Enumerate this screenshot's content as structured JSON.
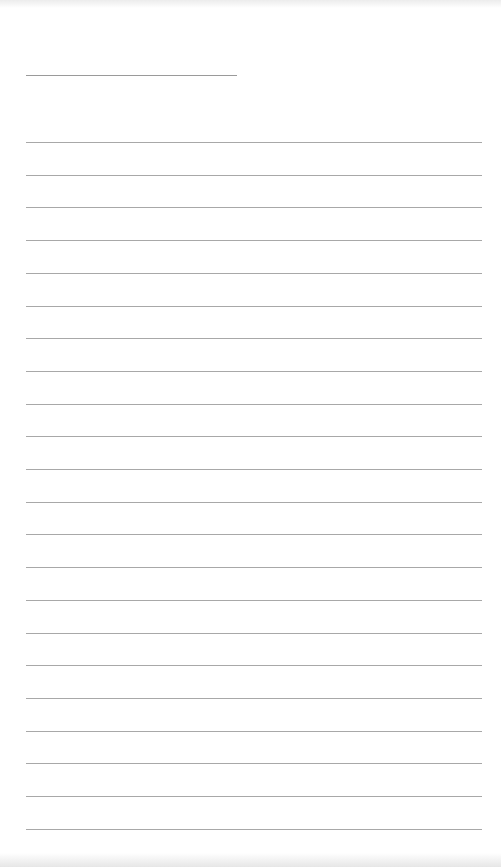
{
  "page": {
    "type": "lined-paper",
    "background_color": "#ffffff",
    "line_color": "#a8a8a8",
    "title_line": {
      "x": 26,
      "y": 75,
      "width": 211
    },
    "ruled_lines": {
      "count": 22,
      "x": 26,
      "width": 456,
      "first_y": 142,
      "spacing": 32.7
    },
    "text": []
  }
}
